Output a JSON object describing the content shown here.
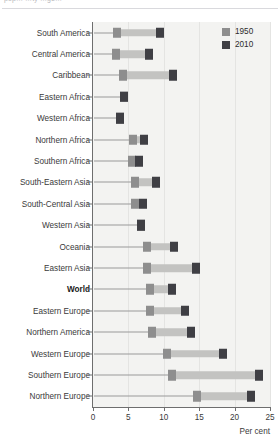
{
  "caption": {
    "cropped_text": "pop… …ty …ge…"
  },
  "legend": {
    "position": "top-right",
    "items": [
      {
        "label": "1950",
        "color": "#8e8e8e"
      },
      {
        "label": "2010",
        "color": "#3f3f44"
      }
    ]
  },
  "axis": {
    "x_title": "Per cent",
    "x_ticks": [
      "0",
      "5",
      "10",
      "15",
      "20",
      "25"
    ]
  },
  "chart_data": {
    "type": "bar",
    "title": "",
    "subtitle": "",
    "xlabel": "Per cent",
    "ylabel": "",
    "xlim": [
      0,
      25
    ],
    "grid": true,
    "legend_position": "top-right",
    "orientation": "horizontal",
    "note": "Dumbbell / range chart: each row shows the 1950 value and the 2010 value joined by a grey span bar.",
    "categories": [
      "South America",
      "Central America",
      "Caribbean",
      "Eastern Africa",
      "Western Africa",
      "Northern Africa",
      "Southern Africa",
      "South-Eastern Asia",
      "South-Central Asia",
      "Western Asia",
      "Oceania",
      "Eastern Asia",
      "World",
      "Eastern Europe",
      "Northern America",
      "Western Europe",
      "Southern Europe",
      "Northern Europe"
    ],
    "emphasis": [
      "World"
    ],
    "series": [
      {
        "name": "1950",
        "color": "#8e8e8e",
        "values": [
          3.4,
          3.2,
          4.2,
          4.4,
          3.8,
          5.6,
          5.5,
          6.0,
          5.9,
          6.8,
          7.6,
          7.6,
          8.0,
          8.0,
          8.3,
          10.4,
          11.2,
          14.7
        ]
      },
      {
        "name": "2010",
        "color": "#3f3f44",
        "values": [
          9.5,
          7.9,
          11.3,
          4.4,
          3.8,
          7.2,
          6.5,
          8.9,
          7.0,
          6.8,
          11.4,
          14.6,
          11.2,
          13.0,
          13.8,
          18.4,
          23.4,
          22.3
        ]
      }
    ]
  }
}
